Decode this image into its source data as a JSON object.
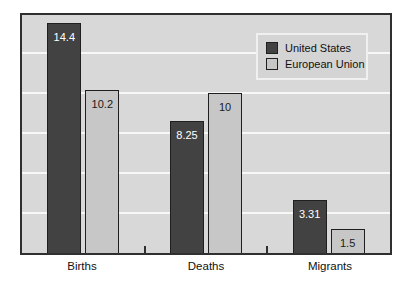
{
  "chart_data": {
    "type": "bar",
    "title": "",
    "xlabel": "",
    "ylabel": "",
    "categories": [
      "Births",
      "Deaths",
      "Migrants"
    ],
    "series": [
      {
        "name": "United States",
        "values": [
          14.4,
          8.25,
          3.31
        ],
        "labels": [
          "14.4",
          "8.25",
          "3.31"
        ],
        "color": "#424242",
        "label_color": "#ffffff"
      },
      {
        "name": "European Union",
        "values": [
          10.2,
          10,
          1.5
        ],
        "labels": [
          "10.2",
          "10",
          "1.5"
        ],
        "color": "#c7c7c7",
        "label_color": "#1a1a1a"
      }
    ],
    "ylim": [
      0,
      14.9
    ],
    "gridline_values": [
      2.5,
      5,
      7.5,
      10,
      12.5
    ],
    "grid": "horizontal-white-lines",
    "legend": {
      "position": "top-right",
      "entries": [
        "United States",
        "European Union"
      ]
    },
    "style": {
      "plot_background": "#d8d8d8",
      "page_background": "#ffffff",
      "gridline_color": "#f7f7f7",
      "frame_border_color": "#2f2f2f",
      "bar_border_color": "#1f1f1f",
      "legend_background": "#d4d4d4",
      "legend_border_color": "#f0f0f0",
      "tick_color": "#2f2f2f"
    }
  }
}
